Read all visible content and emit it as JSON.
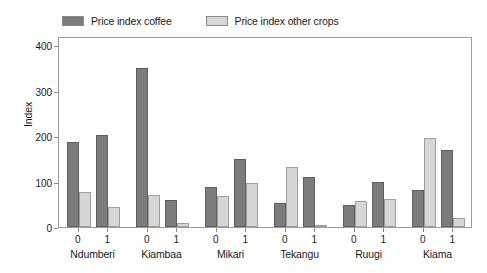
{
  "legend": {
    "entries": [
      {
        "label": "Price index coffee",
        "color": "#7c7c7c",
        "icon": "legend-swatch-icon"
      },
      {
        "label": "Price index other crops",
        "color": "#d6d6d6",
        "icon": "legend-swatch-icon"
      }
    ]
  },
  "axes": {
    "y_title": "Index",
    "y_ticks": [
      "0",
      "100",
      "200",
      "300",
      "400"
    ],
    "x_sub_labels": [
      "0",
      "1"
    ]
  },
  "chart_data": {
    "type": "bar",
    "title": "",
    "subtitle": "",
    "xlabel": "",
    "ylabel": "Index",
    "ylim": [
      0,
      420
    ],
    "yticks": [
      0,
      100,
      200,
      300,
      400
    ],
    "grid": false,
    "legend_position": "top-left",
    "groups": [
      "Ndumberi",
      "Kiambaa",
      "Mikari",
      "Tekangu",
      "Ruugi",
      "Kiama"
    ],
    "subcategories": [
      "0",
      "1"
    ],
    "categories": [
      "Ndumberi 0",
      "Ndumberi 1",
      "Kiambaa 0",
      "Kiambaa 1",
      "Mikari 0",
      "Mikari 1",
      "Tekangu 0",
      "Tekangu 1",
      "Ruugi 0",
      "Ruugi 1",
      "Kiama 0",
      "Kiama 1"
    ],
    "series": [
      {
        "name": "Price index coffee",
        "color": "#7c7c7c",
        "values": [
          187,
          203,
          349,
          60,
          89,
          150,
          52,
          110,
          48,
          98,
          82,
          170
        ]
      },
      {
        "name": "Price index other crops",
        "color": "#d6d6d6",
        "values": [
          76,
          44,
          71,
          8,
          68,
          97,
          132,
          3,
          57,
          62,
          196,
          20
        ]
      }
    ]
  }
}
